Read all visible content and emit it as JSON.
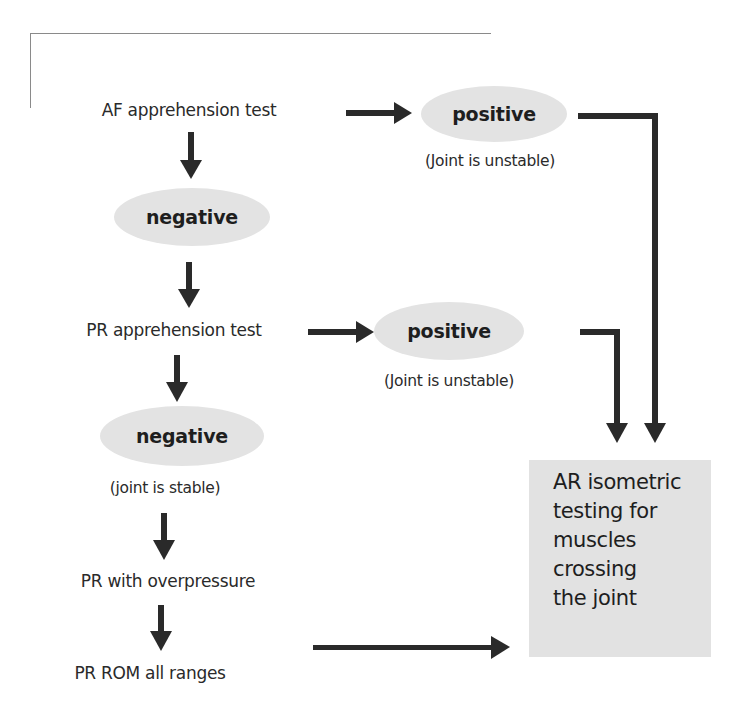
{
  "frame": {
    "border_color": "#8a8a8a"
  },
  "colors": {
    "oval_fill": "#e3e3e3",
    "box_fill": "#e2e2e2",
    "arrow": "#2a2a2a",
    "text": "#2a2a2a"
  },
  "flow": {
    "step1": {
      "label": "AF apprehension test"
    },
    "step1_negative": {
      "label": "negative"
    },
    "step1_positive": {
      "label": "positive",
      "note": "(Joint is unstable)"
    },
    "step2": {
      "label": "PR apprehension test"
    },
    "step2_negative": {
      "label": "negative",
      "note": "(joint is stable)"
    },
    "step2_positive": {
      "label": "positive",
      "note": "(Joint is unstable)"
    },
    "step3": {
      "label": "PR with overpressure"
    },
    "step4": {
      "label": "PR ROM all ranges"
    },
    "result": {
      "lines": [
        "AR isometric",
        "testing for",
        "muscles",
        "crossing",
        "the joint"
      ]
    }
  },
  "icons": {
    "arrow_down": "down-arrow-icon",
    "arrow_right": "right-arrow-icon",
    "elbow_connector": "elbow-connector-arrow-icon"
  }
}
